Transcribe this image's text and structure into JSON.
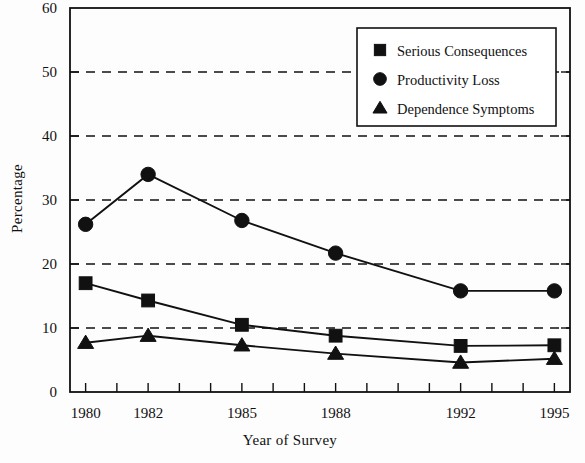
{
  "chart_data": {
    "type": "line",
    "title": "",
    "xlabel": "Year of Survey",
    "ylabel": "Percentage",
    "categories": [
      "1980",
      "1982",
      "1985",
      "1988",
      "1992",
      "1995"
    ],
    "x": [
      1980,
      1982,
      1985,
      1988,
      1992,
      1995
    ],
    "xlim": [
      1979.5,
      1995.5
    ],
    "ylim": [
      0,
      60
    ],
    "yticks": [
      "0",
      "10",
      "20",
      "30",
      "40",
      "50",
      "60"
    ],
    "ytick_values": [
      0,
      10,
      20,
      30,
      40,
      50,
      60
    ],
    "xticks": [
      "1980",
      "1982",
      "1985",
      "1988",
      "1992",
      "1995"
    ],
    "grid": "horizontal-dashed",
    "legend_position": "top-right",
    "series": [
      {
        "name": "Serious Consequences",
        "marker": "square",
        "values": [
          17.0,
          14.3,
          10.5,
          8.8,
          7.2,
          7.3
        ]
      },
      {
        "name": "Productivity Loss",
        "marker": "circle",
        "values": [
          26.2,
          34.0,
          26.8,
          21.7,
          15.8,
          15.8
        ]
      },
      {
        "name": "Dependence Symptoms",
        "marker": "triangle",
        "values": [
          7.7,
          8.8,
          7.3,
          6.0,
          4.6,
          5.2
        ]
      }
    ],
    "colors": {
      "line": "#111111",
      "marker": "#111111",
      "grid": "#111111",
      "background": "#fdfdfd"
    }
  },
  "legend": {
    "entries": [
      {
        "label": "Serious Consequences",
        "marker": "square"
      },
      {
        "label": "Productivity Loss",
        "marker": "circle"
      },
      {
        "label": "Dependence Symptoms",
        "marker": "triangle"
      }
    ]
  },
  "axes": {
    "y_title": "Percentage",
    "x_title": "Year of Survey",
    "y_tick_labels": [
      "60",
      "50",
      "40",
      "30",
      "20",
      "10",
      "0"
    ],
    "x_tick_labels": [
      "1980",
      "1982",
      "1985",
      "1988",
      "1992",
      "1995"
    ]
  }
}
